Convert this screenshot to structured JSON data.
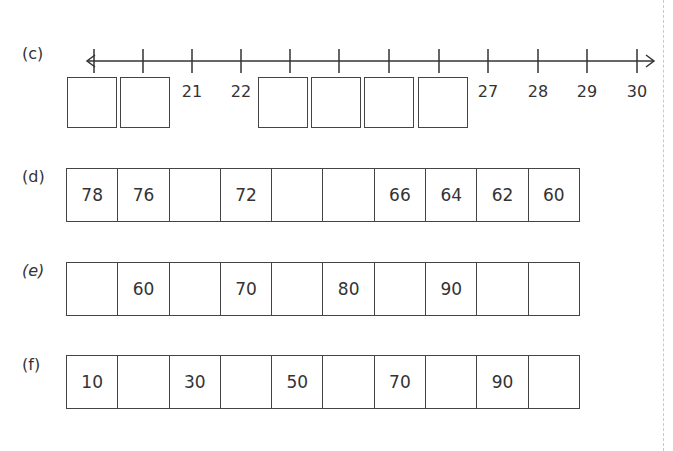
{
  "worksheet": {
    "part_c": {
      "label": "(c)",
      "number_line": {
        "start": 19,
        "end": 30,
        "arrow_left": true,
        "arrow_right": true,
        "ticks": [
          {
            "value": 19,
            "label": "",
            "boxed": true
          },
          {
            "value": 20,
            "label": "",
            "boxed": true
          },
          {
            "value": 21,
            "label": "21",
            "boxed": false
          },
          {
            "value": 22,
            "label": "22",
            "boxed": false
          },
          {
            "value": 23,
            "label": "",
            "boxed": true
          },
          {
            "value": 24,
            "label": "",
            "boxed": true
          },
          {
            "value": 25,
            "label": "",
            "boxed": true
          },
          {
            "value": 26,
            "label": "",
            "boxed": true
          },
          {
            "value": 27,
            "label": "27",
            "boxed": false
          },
          {
            "value": 28,
            "label": "28",
            "boxed": false
          },
          {
            "value": 29,
            "label": "29",
            "boxed": false
          },
          {
            "value": 30,
            "label": "30",
            "boxed": false
          }
        ],
        "answer_boxes": [
          "",
          "",
          "",
          "",
          "",
          ""
        ]
      }
    },
    "part_d": {
      "label": "(d)",
      "cells": [
        "78",
        "76",
        "",
        "72",
        "",
        "",
        "66",
        "64",
        "62",
        "60"
      ]
    },
    "part_e": {
      "label": "(e)",
      "cells": [
        "",
        "60",
        "",
        "70",
        "",
        "80",
        "",
        "90",
        "",
        ""
      ]
    },
    "part_f": {
      "label": "(f)",
      "cells": [
        "10",
        "",
        "30",
        "",
        "50",
        "",
        "70",
        "",
        "90",
        ""
      ]
    }
  }
}
